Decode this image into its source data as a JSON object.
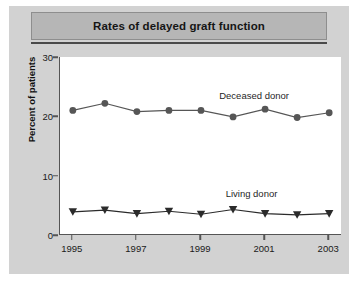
{
  "figure": {
    "title": "Rates of delayed graft function",
    "background_color": "#d2d2d2",
    "title_band_color": "#b6b6b6",
    "plot_background_color": "#ffffff"
  },
  "chart_data": {
    "type": "line",
    "title": "Rates of delayed graft function",
    "xlabel": "",
    "ylabel": "Percent of patients",
    "x": [
      1995,
      1996,
      1997,
      1998,
      1999,
      2000,
      2001,
      2002,
      2003
    ],
    "xlim": [
      1994.6,
      2003.4
    ],
    "ylim": [
      0,
      30
    ],
    "yticks": [
      0,
      10,
      20,
      30
    ],
    "ytick_labels": [
      "0",
      "10",
      "20",
      "30"
    ],
    "xticks": [
      1995,
      1997,
      1999,
      2001,
      2003
    ],
    "xtick_labels": [
      "1995",
      "1997",
      "1999",
      "2001",
      "2003"
    ],
    "grid": false,
    "legend_position": "inline-annotation",
    "series": [
      {
        "name": "Deceased donor",
        "marker": "circle",
        "color": "#565656",
        "values": [
          21.0,
          22.2,
          20.8,
          21.0,
          21.0,
          19.9,
          21.2,
          19.8,
          20.6
        ],
        "label_text": "Deceased donor"
      },
      {
        "name": "Living donor",
        "marker": "triangle-down",
        "color": "#2b2b2b",
        "values": [
          3.9,
          4.2,
          3.6,
          4.0,
          3.5,
          4.3,
          3.6,
          3.4,
          3.6
        ],
        "label_text": "Living donor"
      }
    ]
  }
}
